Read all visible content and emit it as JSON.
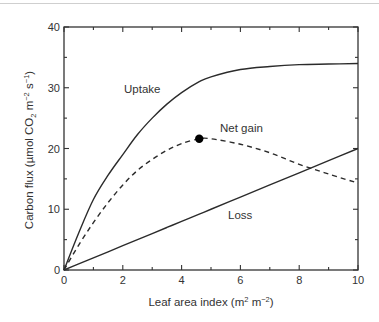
{
  "chart_data": {
    "type": "line",
    "title": "",
    "xlabel": "Leaf area index (m² m⁻²)",
    "ylabel": "Carbon flux (µmol CO₂ m⁻² s⁻¹)",
    "xlim": [
      0,
      10
    ],
    "ylim": [
      0,
      40
    ],
    "xticks": [
      0,
      2,
      4,
      6,
      8,
      10
    ],
    "yticks": [
      0,
      10,
      20,
      30,
      40
    ],
    "x_minor_ticks": [
      1,
      3,
      5,
      7,
      9
    ],
    "y_minor_ticks": [
      5,
      15,
      25,
      35
    ],
    "grid": false,
    "legend": "none (inline annotations)",
    "x": [
      0,
      0.5,
      1,
      1.5,
      2,
      2.5,
      3,
      3.5,
      4,
      4.6,
      5,
      6,
      7,
      8,
      9,
      10
    ],
    "series": [
      {
        "name": "Uptake",
        "style": "solid",
        "values": [
          0,
          6.1,
          11.6,
          15.6,
          19.0,
          22.3,
          25.0,
          27.3,
          29.2,
          31.0,
          31.8,
          33.0,
          33.5,
          33.8,
          33.9,
          34.0
        ]
      },
      {
        "name": "Net gain",
        "style": "dashed",
        "values": [
          0,
          4.1,
          7.8,
          11.1,
          14.0,
          16.4,
          18.2,
          19.7,
          20.8,
          21.6,
          21.6,
          20.7,
          19.3,
          17.4,
          15.8,
          14.3
        ]
      },
      {
        "name": "Loss",
        "style": "solid",
        "values": [
          0,
          1.0,
          2.0,
          3.0,
          4.0,
          5.0,
          6.0,
          7.0,
          8.0,
          9.2,
          10.0,
          12.0,
          14.0,
          16.0,
          18.0,
          20.0
        ]
      }
    ],
    "annotations": [
      {
        "text": "Uptake",
        "x": 2.1,
        "y": 29.5
      },
      {
        "text": "Net gain",
        "x": 6.8,
        "y": 23.4
      },
      {
        "text": "Loss",
        "x": 5.9,
        "y": 9.0
      },
      {
        "marker": "filled-circle",
        "label": "Net gain maximum",
        "x": 4.6,
        "y": 21.6
      }
    ]
  },
  "labels": {
    "xlabel_main": "Leaf area index (m",
    "xlabel_sup1": "2",
    "xlabel_mid": " m",
    "xlabel_sup2": "−2",
    "xlabel_end": ")",
    "ylabel_main": "Carbon flux (µmol CO",
    "ylabel_sub": "2",
    "ylabel_mid": " m",
    "ylabel_sup1": "−2",
    "ylabel_mid2": " s",
    "ylabel_sup2": "−1",
    "ylabel_end": ")",
    "uptake": "Uptake",
    "net_gain": "Net gain",
    "loss": "Loss"
  },
  "colors": {
    "line": "#2b2b2b",
    "axis": "#333333",
    "marker": "#000000",
    "topline": "#cfcfcf"
  }
}
